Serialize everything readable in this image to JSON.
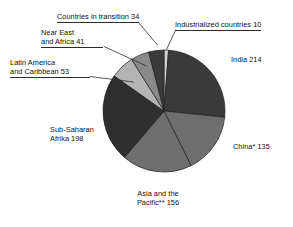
{
  "chart_data": {
    "type": "pie",
    "title": "",
    "units": "millions",
    "total": 841,
    "legend_position": "callout-labels",
    "grid": false,
    "start_angle_deg": -90,
    "direction": "clockwise",
    "categories": [
      "Industrialized countries",
      "India",
      "China*",
      "Asia and the Pacific**",
      "Sub-Saharan Africa",
      "Latin America and Caribbean",
      "Near East and Africa",
      "Countries in transition"
    ],
    "values": [
      10,
      214,
      135,
      156,
      198,
      53,
      41,
      34
    ],
    "slices": [
      {
        "label": "Industrialized countries 10",
        "name": "Industrialized countries",
        "value": 10,
        "color": "#d2d2d2"
      },
      {
        "label": "India 214",
        "name": "India",
        "value": 214,
        "color": "#3a3a3a"
      },
      {
        "label": "China* 135",
        "name": "China*",
        "value": 135,
        "color": "#6e6e6e"
      },
      {
        "label": "Asia and the Pacific** 156",
        "name": "Asia and the Pacific**",
        "value": 156,
        "color": "#6e6e6e"
      },
      {
        "label": "Sub-Saharan Africa 198",
        "name": "Sub-Saharan Africa",
        "value": 198,
        "color": "#2f2f2f"
      },
      {
        "label": "Latin America and Caribbean 53",
        "name": "Latin America and Caribbean",
        "value": 53,
        "color": "#b4b4b4"
      },
      {
        "label": "Near East and Africa 41",
        "name": "Near East and Africa",
        "value": 41,
        "color": "#8a8a8a"
      },
      {
        "label": "Countries in transition 34",
        "name": "Countries in transition",
        "value": 34,
        "color": "#3a3a3a"
      }
    ]
  },
  "labels": {
    "countries_in_transition": "Countries in transition 34",
    "industrialized_countries": "Industrialized countries 10",
    "near_east_line1": "Near East",
    "near_east_line2": "and Africa 41",
    "latin_america_line1": "Latin America",
    "latin_america_line2": "and Caribbean 53",
    "sub_saharan_line1": "Sub-Saharan",
    "sub_saharan_line2": "Afrika 198",
    "india": "India 214",
    "china": "China* 135",
    "asia_pacific_line1": "Asia and the",
    "asia_pacific_line2": "Pacific** 156"
  },
  "colors": {
    "background": "#ffffff",
    "text": "#111111",
    "leader_line": "#2b2b2b",
    "slice_outline": "#1f1f1f"
  }
}
